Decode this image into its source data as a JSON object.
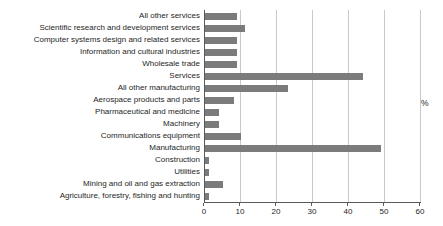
{
  "chart_data": {
    "type": "bar",
    "orientation": "horizontal",
    "title": "",
    "xlabel": "",
    "ylabel": "",
    "unit_label": "%",
    "categories": [
      "All other services",
      "Scientific research and development services",
      "Computer systems design and related services",
      "Information and cultural industries",
      "Wholesale trade",
      "Services",
      "All other manufacturing",
      "Aerospace products and parts",
      "Pharmaceutical and medicine",
      "Machinery",
      "Communications equipment",
      "Manufacturing",
      "Construction",
      "Utilities",
      "Mining and oil and gas extraction",
      "Agriculture, forestry, fishing and hunting"
    ],
    "values": [
      9,
      11,
      9,
      9,
      9,
      44,
      23,
      8,
      4,
      4,
      10,
      49,
      1,
      1,
      5,
      1
    ],
    "xlim": [
      0,
      60
    ],
    "xticks": [
      0,
      10,
      20,
      30,
      40,
      50,
      60
    ],
    "grid": "vertical",
    "legend": "none",
    "colors": {
      "bar": "#7b7b7b",
      "gridline": "#c9c9c9",
      "axis": "#595959",
      "text": "#262626"
    }
  }
}
